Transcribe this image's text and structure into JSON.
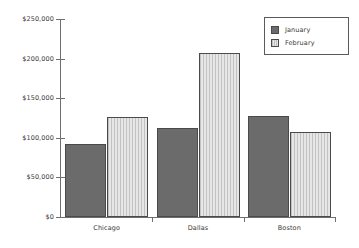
{
  "chart_data": {
    "type": "bar",
    "title": "",
    "xlabel": "",
    "ylabel": "",
    "categories": [
      "Chicago",
      "Dallas",
      "Boston"
    ],
    "series": [
      {
        "name": "January",
        "values": [
          92000,
          112000,
          128000
        ],
        "color": "#6b6b6b"
      },
      {
        "name": "February",
        "values": [
          126000,
          207000,
          107000
        ],
        "color": "#cfcfcf"
      }
    ],
    "ylim": [
      0,
      250000
    ],
    "yticks": [
      0,
      50000,
      100000,
      150000,
      200000,
      250000
    ],
    "ytick_labels": [
      "$0",
      "$50,000",
      "$100,000",
      "$150,000",
      "$200,000",
      "$250,000"
    ],
    "grid": false,
    "legend_position": "top-right"
  },
  "legend": {
    "items": [
      {
        "label": "January"
      },
      {
        "label": "February"
      }
    ]
  },
  "axes": {
    "y_labels": [
      "$250,000",
      "$200,000",
      "$150,000",
      "$100,000",
      "$50,000",
      "$0"
    ],
    "x_labels": [
      "Chicago",
      "Dallas",
      "Boston"
    ]
  }
}
